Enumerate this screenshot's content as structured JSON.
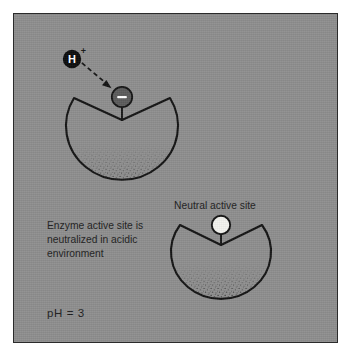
{
  "figure": {
    "title_semantic": "enzyme-active-site-ph-diagram",
    "panel_background": "#8e8e8e",
    "panel_border": "#2b2b2b",
    "ink_color": "#141414"
  },
  "labels": {
    "caption_line_1": "Enzyme active site is",
    "caption_line_2": "neutralized in acidic",
    "caption_line_3": "environment",
    "neutral_site_label": "Neutral active site",
    "ph_label": "pH  =  3"
  },
  "ions": {
    "proton_letter": "H",
    "proton_charge": "+",
    "proton_fill": "#0d0d0d",
    "proton_text_color": "#ffffff",
    "negative_site_symbol": "–",
    "negative_site_fill": "#5b5b5b",
    "negative_site_stroke": "#141414",
    "neutral_site_fill": "#f2f2ee",
    "neutral_site_stroke": "#141414"
  },
  "enzymes": [
    {
      "name": "acidic-enzyme",
      "state": "neutralized",
      "site_charge": "negative"
    },
    {
      "name": "neutral-enzyme",
      "state": "active",
      "site_charge": "neutral"
    }
  ]
}
